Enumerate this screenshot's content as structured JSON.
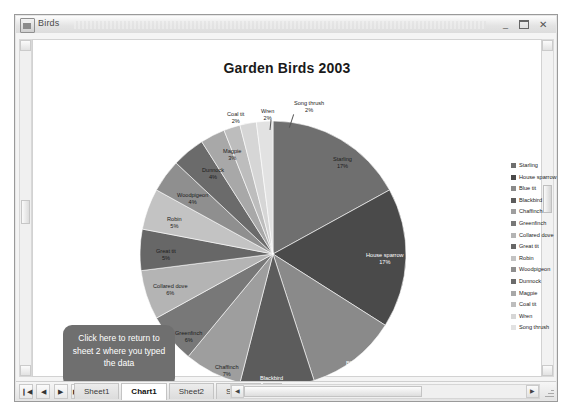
{
  "window": {
    "title": "Birds",
    "icon": "excel-workbook-icon",
    "controls": {
      "minimize": "–",
      "maximize": "❐",
      "close": "✕"
    }
  },
  "chart_data": {
    "type": "pie",
    "title": "Garden Birds 2003",
    "xlabel": "",
    "ylabel": "",
    "legend_position": "right",
    "grid": false,
    "categories": [
      "Starling",
      "House sparrow",
      "Blue tit",
      "Blackbird",
      "Chaffinch",
      "Greenfinch",
      "Collared dove",
      "Great tit",
      "Robin",
      "Woodpigeon",
      "Dunnock",
      "Magpie",
      "Coal tit",
      "Wren",
      "Song thrush"
    ],
    "values": [
      17,
      17,
      11,
      9,
      7,
      6,
      6,
      5,
      5,
      4,
      4,
      3,
      2,
      2,
      2
    ],
    "value_unit": "%",
    "data_labels": [
      {
        "name": "Starling",
        "value": "17%",
        "label": "Starling\n17%"
      },
      {
        "name": "House sparrow",
        "value": "17%",
        "label": "House sparrow\n17%"
      },
      {
        "name": "Blue tit",
        "value": "11%",
        "label": "Blue tit\n11%"
      },
      {
        "name": "Blackbird",
        "value": "9%",
        "label": "Blackbird\n9%"
      },
      {
        "name": "Chaffinch",
        "value": "7%",
        "label": "Chaffinch\n7%"
      },
      {
        "name": "Greenfinch",
        "value": "6%",
        "label": "Greenfinch\n6%"
      },
      {
        "name": "Collared dove",
        "value": "6%",
        "label": "Collared dove\n6%"
      },
      {
        "name": "Great tit",
        "value": "5%",
        "label": "Great tit\n5%"
      },
      {
        "name": "Robin",
        "value": "5%",
        "label": "Robin\n5%"
      },
      {
        "name": "Woodpigeon",
        "value": "4%",
        "label": "Woodpigeon\n4%"
      },
      {
        "name": "Dunnock",
        "value": "4%",
        "label": "Dunnock\n4%"
      },
      {
        "name": "Magpie",
        "value": "3%",
        "label": "Magpie\n3%"
      },
      {
        "name": "Coal tit",
        "value": "2%",
        "label": "Coal tit\n2%"
      },
      {
        "name": "Wren",
        "value": "2%",
        "label": "Wren\n2%"
      },
      {
        "name": "Song thrush",
        "value": "2%",
        "label": "Song thrush\n2%"
      }
    ],
    "colors": [
      "#6f6f6f",
      "#4a4a4a",
      "#8a8a8a",
      "#5c5c5c",
      "#9e9e9e",
      "#787878",
      "#b4b4b4",
      "#676767",
      "#c3c3c3",
      "#8f8f8f",
      "#6b6b6b",
      "#a8a8a8",
      "#bdbdbd",
      "#d6d6d6",
      "#e2e2e2"
    ]
  },
  "pie_labels": [
    {
      "name": "starling",
      "line1": "Starling",
      "line2": "17%",
      "x": 194,
      "y": 36,
      "invert": false
    },
    {
      "name": "house-sparrow",
      "line1": "House sparrow",
      "line2": "17%",
      "x": 227,
      "y": 132,
      "invert": true
    },
    {
      "name": "blue-tit",
      "line1": "Blue tit",
      "line2": "11%",
      "x": 207,
      "y": 240,
      "invert": true
    },
    {
      "name": "blackbird",
      "line1": "Blackbird",
      "line2": "9%",
      "x": 121,
      "y": 255,
      "invert": true
    },
    {
      "name": "chaffinch",
      "line1": "Chaffinch",
      "line2": "7%",
      "x": 76,
      "y": 244,
      "invert": false
    },
    {
      "name": "greenfinch",
      "line1": "Greenfinch",
      "line2": "6%",
      "x": 36,
      "y": 210,
      "invert": false
    },
    {
      "name": "collared-dove",
      "line1": "Collared dove",
      "line2": "6%",
      "x": 14,
      "y": 163,
      "invert": false
    },
    {
      "name": "great-tit",
      "line1": "Great tit",
      "line2": "5%",
      "x": 17,
      "y": 128,
      "invert": false
    },
    {
      "name": "robin",
      "line1": "Robin",
      "line2": "5%",
      "x": 28,
      "y": 96,
      "invert": false
    },
    {
      "name": "woodpigeon",
      "line1": "Woodpigeon",
      "line2": "4%",
      "x": 38,
      "y": 72,
      "invert": false
    },
    {
      "name": "dunnock",
      "line1": "Dunnock",
      "line2": "4%",
      "x": 63,
      "y": 47,
      "invert": false
    },
    {
      "name": "magpie",
      "line1": "Magpie",
      "line2": "3%",
      "x": 84,
      "y": 28,
      "invert": false
    },
    {
      "name": "coal-tit",
      "line1": "Coal tit",
      "line2": "2%",
      "x": 88,
      "y": -9,
      "invert": false
    },
    {
      "name": "wren",
      "line1": "Wren",
      "line2": "2%",
      "x": 122,
      "y": -12,
      "invert": false
    },
    {
      "name": "song-thrush",
      "line1": "Song thrush",
      "line2": "2%",
      "x": 155,
      "y": -20,
      "invert": false
    }
  ],
  "legend": {
    "items": [
      {
        "label": "Starling",
        "color": "#6f6f6f"
      },
      {
        "label": "House sparrow",
        "color": "#4a4a4a"
      },
      {
        "label": "Blue tit",
        "color": "#8a8a8a"
      },
      {
        "label": "Blackbird",
        "color": "#5c5c5c"
      },
      {
        "label": "Chaffinch",
        "color": "#9e9e9e"
      },
      {
        "label": "Greenfinch",
        "color": "#787878"
      },
      {
        "label": "Collared dove",
        "color": "#b4b4b4"
      },
      {
        "label": "Great tit",
        "color": "#676767"
      },
      {
        "label": "Robin",
        "color": "#c3c3c3"
      },
      {
        "label": "Woodpigeon",
        "color": "#8f8f8f"
      },
      {
        "label": "Dunnock",
        "color": "#6b6b6b"
      },
      {
        "label": "Magpie",
        "color": "#a8a8a8"
      },
      {
        "label": "Coal tit",
        "color": "#bdbdbd"
      },
      {
        "label": "Wren",
        "color": "#d6d6d6"
      },
      {
        "label": "Song thrush",
        "color": "#e2e2e2"
      }
    ]
  },
  "callout": {
    "text": "Click here to return to sheet 2 where you typed the data",
    "bg": "#6f6f6f",
    "text_color": "#ffffff"
  },
  "sheet_tabs": {
    "nav": [
      "|◀",
      "◀",
      "▶",
      "▶|"
    ],
    "tabs": [
      {
        "label": "Sheet1",
        "active": false
      },
      {
        "label": "Chart1",
        "active": true
      },
      {
        "label": "Sheet2",
        "active": false
      },
      {
        "label": "Sheet3",
        "active": false
      }
    ],
    "new_tab_label": "↰"
  }
}
